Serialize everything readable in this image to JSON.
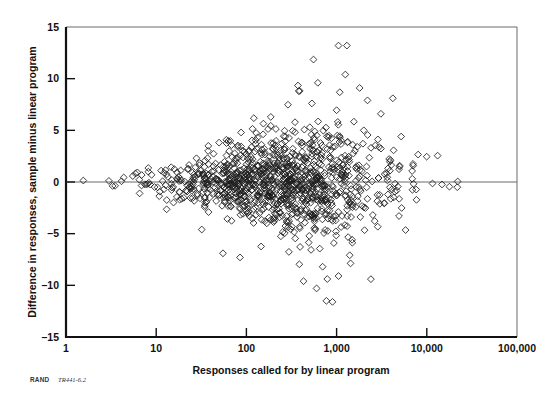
{
  "figure": {
    "source_note_prefix": "RAND",
    "source_note_id": "TR441-6.2"
  },
  "chart_data": {
    "type": "scatter",
    "title": "",
    "xlabel": "Responses called for by linear program",
    "ylabel": "Difference in responses, sample minus linear program",
    "xscale": "log",
    "yscale": "linear",
    "xlim": [
      1,
      100000
    ],
    "ylim": [
      -15,
      15
    ],
    "xticks": [
      1,
      10,
      100,
      1000,
      10000,
      100000
    ],
    "xticklabels": [
      "1",
      "10",
      "100",
      "1,000",
      "10,000",
      "100,000"
    ],
    "yticks": [
      -15,
      -10,
      -5,
      0,
      5,
      10,
      15
    ],
    "yticklabels": [
      "–15",
      "–10",
      "–5",
      "0",
      "5",
      "10",
      "15"
    ],
    "grid": false,
    "legend": null,
    "marker": {
      "shape": "diamond",
      "filled": false,
      "edge_color": "#1c1c1c",
      "size": 3.4
    },
    "reference_lines": [
      {
        "axis": "y",
        "value": 0,
        "color": "#6b6b6b"
      }
    ],
    "series": [
      {
        "name": "Difference vs. linear program responses",
        "n_points": 1100,
        "description": "Heteroscedastic fan: scatter in the difference widens as the linear-program response count grows, centered on zero.",
        "spread_model": {
          "center": 0,
          "sd_at_x": [
            {
              "x": 1,
              "sd": 0.12
            },
            {
              "x": 3,
              "sd": 0.3
            },
            {
              "x": 10,
              "sd": 0.75
            },
            {
              "x": 30,
              "sd": 1.35
            },
            {
              "x": 100,
              "sd": 1.9
            },
            {
              "x": 300,
              "sd": 2.5
            },
            {
              "x": 1000,
              "sd": 3.0
            },
            {
              "x": 3000,
              "sd": 2.6
            },
            {
              "x": 10000,
              "sd": 1.2
            },
            {
              "x": 30000,
              "sd": 0.4
            }
          ]
        },
        "x_density": {
          "mode": 250,
          "log_sd": 0.62,
          "log_min": 0,
          "log_max": 4.4
        },
        "notable_points": [
          {
            "x": 1050,
            "y": 13.2
          },
          {
            "x": 1300,
            "y": 13.2
          },
          {
            "x": 1250,
            "y": 10.4
          },
          {
            "x": 620,
            "y": 9.6
          },
          {
            "x": 1800,
            "y": 9.1
          },
          {
            "x": 380,
            "y": 8.8
          },
          {
            "x": 2200,
            "y": 7.9
          },
          {
            "x": 4200,
            "y": 8.1
          },
          {
            "x": 3100,
            "y": 6.6
          },
          {
            "x": 2000,
            "y": 5.0
          },
          {
            "x": 5200,
            "y": 4.4
          },
          {
            "x": 22000,
            "y": 0.05
          },
          {
            "x": 32,
            "y": -4.6
          },
          {
            "x": 55,
            "y": -6.9
          },
          {
            "x": 85,
            "y": -7.3
          },
          {
            "x": 700,
            "y": -8.2
          },
          {
            "x": 1050,
            "y": -9.1
          },
          {
            "x": 430,
            "y": -9.6
          },
          {
            "x": 600,
            "y": -10.3
          },
          {
            "x": 2400,
            "y": -9.4
          },
          {
            "x": 900,
            "y": -11.6
          }
        ]
      }
    ]
  }
}
